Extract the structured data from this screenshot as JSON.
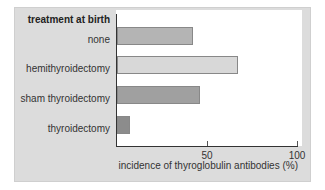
{
  "chart_data": {
    "type": "bar",
    "orientation": "horizontal",
    "title": "treatment at birth",
    "xlabel": "incidence of thyroglobulin antibodies (%)",
    "ylabel": "treatment at birth",
    "categories": [
      "none",
      "hemithyroidectomy",
      "sham thyroidectomy",
      "thyroidectomy"
    ],
    "values": [
      42,
      67,
      46,
      7
    ],
    "xlim": [
      0,
      100
    ],
    "xticks": [
      "50",
      "100"
    ],
    "grid": false,
    "legend": null,
    "bar_colors": [
      "#b4b4b4",
      "#d8d8d8",
      "#a0a0a0",
      "#8c8c8c"
    ]
  }
}
